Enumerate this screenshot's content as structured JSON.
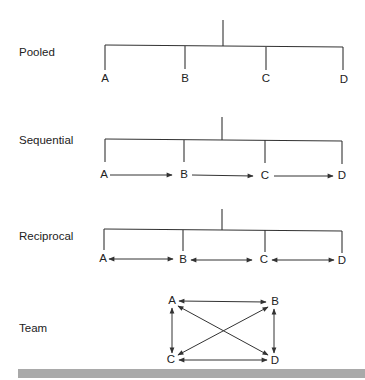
{
  "rows": [
    {
      "label": "Pooled",
      "type": "pooled",
      "nodes": [
        "A",
        "B",
        "C",
        "D"
      ]
    },
    {
      "label": "Sequential",
      "type": "sequential",
      "nodes": [
        "A",
        "B",
        "C",
        "D"
      ]
    },
    {
      "label": "Reciprocal",
      "type": "reciprocal",
      "nodes": [
        "A",
        "B",
        "C",
        "D"
      ]
    },
    {
      "label": "Team",
      "type": "team",
      "nodes": [
        "A",
        "B",
        "C",
        "D"
      ]
    }
  ],
  "colors": {
    "line": "#333333",
    "text": "#222222",
    "footer_bar": "#a9a9a9"
  }
}
